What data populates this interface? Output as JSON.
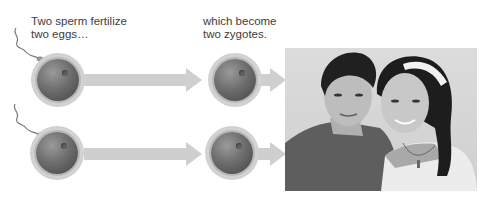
{
  "captions": {
    "left": "Two sperm fertilize\ntwo eggs…",
    "right": "which become\ntwo zygotes."
  },
  "diagram": {
    "rows": [
      {
        "stage1": "egg",
        "stage2": "zygote",
        "sperm": true
      },
      {
        "stage1": "egg",
        "stage2": "zygote",
        "sperm": true
      }
    ],
    "photo_alt": "Fraternal twins — a boy and a girl smiling"
  },
  "colors": {
    "arrow": "#cfcfcf",
    "text": "#3d3d3d",
    "cell_core": "#6e6e6e"
  }
}
